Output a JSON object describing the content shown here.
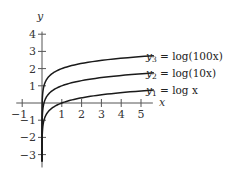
{
  "chart_data": {
    "type": "line",
    "title": "",
    "xlabel": "x",
    "ylabel": "y",
    "xlim": [
      -1.3,
      5.7
    ],
    "ylim": [
      -3.4,
      4.5
    ],
    "grid": false,
    "x_ticks": [
      -1,
      1,
      2,
      3,
      4,
      5
    ],
    "x_tick_labels": [
      "−1",
      "1",
      "2",
      "3",
      "4",
      "5"
    ],
    "y_ticks": [
      4,
      3,
      2,
      1,
      -1,
      -2,
      -3
    ],
    "y_tick_labels": [
      "4",
      "3",
      "2",
      "1",
      "−1",
      "−2",
      "−3"
    ],
    "legend_position": "inline-right",
    "series": [
      {
        "name": "y3 = log(100x)",
        "label_sub": "3",
        "label_expr": " = log(100x)",
        "formula": "log10(100*x)",
        "x": [
          0.001,
          0.01,
          0.05,
          0.1,
          0.2,
          0.5,
          1,
          2,
          3,
          4,
          5,
          5.65
        ],
        "values": [
          -1,
          0,
          0.699,
          1,
          1.301,
          1.699,
          2,
          2.301,
          2.477,
          2.602,
          2.699,
          2.752
        ]
      },
      {
        "name": "y2 = log(10x)",
        "label_sub": "2",
        "label_expr": " = log(10x)",
        "formula": "log10(10*x)",
        "x": [
          0.001,
          0.01,
          0.05,
          0.1,
          0.2,
          0.5,
          1,
          2,
          3,
          4,
          5,
          5.65
        ],
        "values": [
          -2,
          -1,
          -0.301,
          0,
          0.301,
          0.699,
          1,
          1.301,
          1.477,
          1.602,
          1.699,
          1.752
        ]
      },
      {
        "name": "y1 = log x",
        "label_sub": "1",
        "label_expr": " = log x",
        "formula": "log10(x)",
        "x": [
          0.001,
          0.01,
          0.05,
          0.1,
          0.2,
          0.5,
          1,
          2,
          3,
          4,
          5,
          5.65
        ],
        "values": [
          -3,
          -2,
          -1.301,
          -1,
          -0.699,
          -0.301,
          0,
          0.301,
          0.477,
          0.602,
          0.699,
          0.752
        ]
      }
    ]
  }
}
